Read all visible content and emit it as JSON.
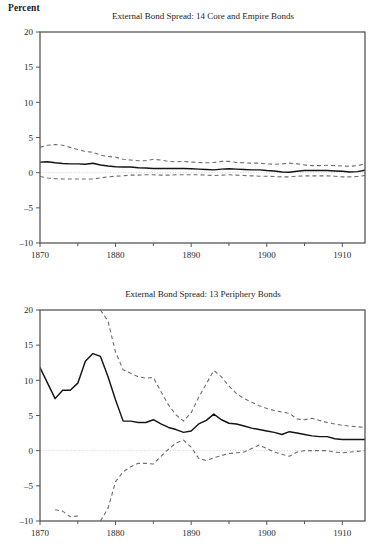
{
  "figure": {
    "axis_unit_label": "Percent",
    "background_color": "#ffffff",
    "mean_line_color": "#141414",
    "band_line_color": "#6d6d6d",
    "frame_color": "#575757",
    "zero_line_color": "#d2d2d2"
  },
  "chart_data": [
    {
      "type": "line",
      "panel_id": "top",
      "title": "External Bond Spread: 14 Core and Empire Bonds",
      "xlabel": "",
      "ylabel": "Percent",
      "xlim": [
        1870,
        1913
      ],
      "ylim": [
        -10,
        20
      ],
      "ytick_labels": [
        "20",
        "15",
        "10",
        "5",
        "0",
        "-5",
        "-10"
      ],
      "ytick_values": [
        20,
        15,
        10,
        5,
        0,
        -5,
        -10
      ],
      "xtick_labels": [
        "1870",
        "1880",
        "1890",
        "1900",
        "1910"
      ],
      "xtick_values": [
        1870,
        1880,
        1890,
        1900,
        1910
      ],
      "xtick_minor_values": [
        1875,
        1885,
        1895,
        1905
      ],
      "grid": false,
      "legend": "none",
      "zero_reference_line": 0,
      "x": [
        1870,
        1871,
        1872,
        1873,
        1874,
        1875,
        1876,
        1877,
        1878,
        1879,
        1880,
        1881,
        1882,
        1883,
        1884,
        1885,
        1886,
        1887,
        1888,
        1889,
        1890,
        1891,
        1892,
        1893,
        1894,
        1895,
        1896,
        1897,
        1898,
        1899,
        1900,
        1901,
        1902,
        1903,
        1904,
        1905,
        1906,
        1907,
        1908,
        1909,
        1910,
        1911,
        1912,
        1913
      ],
      "series": [
        {
          "name": "mean",
          "style": "solid",
          "values": [
            1.5,
            1.55,
            1.4,
            1.3,
            1.25,
            1.25,
            1.2,
            1.35,
            1.1,
            0.95,
            0.85,
            0.8,
            0.8,
            0.7,
            0.65,
            0.6,
            0.6,
            0.6,
            0.6,
            0.6,
            0.55,
            0.5,
            0.45,
            0.4,
            0.5,
            0.55,
            0.5,
            0.45,
            0.4,
            0.4,
            0.3,
            0.25,
            0.1,
            0.05,
            0.2,
            0.3,
            0.3,
            0.3,
            0.3,
            0.25,
            0.2,
            0.1,
            0.15,
            0.35
          ]
        },
        {
          "name": "upper_band",
          "style": "dashed",
          "values": [
            3.6,
            3.9,
            4.0,
            3.9,
            3.6,
            3.3,
            3.0,
            2.9,
            2.5,
            2.3,
            2.2,
            1.9,
            1.8,
            1.7,
            1.7,
            1.9,
            1.8,
            1.6,
            1.55,
            1.6,
            1.5,
            1.45,
            1.4,
            1.45,
            1.6,
            1.6,
            1.45,
            1.4,
            1.35,
            1.35,
            1.25,
            1.2,
            1.25,
            1.35,
            1.25,
            1.1,
            1.0,
            1.0,
            1.05,
            1.0,
            0.95,
            0.9,
            1.0,
            1.25
          ]
        },
        {
          "name": "lower_band",
          "style": "dashed",
          "values": [
            -0.55,
            -0.75,
            -0.85,
            -0.9,
            -0.9,
            -0.9,
            -0.9,
            -0.9,
            -0.75,
            -0.6,
            -0.5,
            -0.45,
            -0.35,
            -0.35,
            -0.3,
            -0.3,
            -0.35,
            -0.35,
            -0.3,
            -0.3,
            -0.3,
            -0.3,
            -0.35,
            -0.4,
            -0.35,
            -0.3,
            -0.35,
            -0.4,
            -0.45,
            -0.5,
            -0.5,
            -0.55,
            -0.6,
            -0.6,
            -0.5,
            -0.45,
            -0.45,
            -0.45,
            -0.45,
            -0.5,
            -0.6,
            -0.6,
            -0.55,
            -0.4
          ]
        }
      ]
    },
    {
      "type": "line",
      "panel_id": "bottom",
      "title": "External Bond Spread: 13 Periphery Bonds",
      "xlabel": "",
      "ylabel": "Percent",
      "xlim": [
        1870,
        1913
      ],
      "ylim": [
        -10,
        20
      ],
      "ytick_labels": [
        "20",
        "15",
        "10",
        "5",
        "0",
        "-5",
        "-10"
      ],
      "ytick_values": [
        20,
        15,
        10,
        5,
        0,
        -5,
        -10
      ],
      "xtick_labels": [
        "1870",
        "1880",
        "1890",
        "1900",
        "1910"
      ],
      "xtick_values": [
        1870,
        1880,
        1890,
        1900,
        1910
      ],
      "xtick_minor_values": [
        1875,
        1885,
        1895,
        1905
      ],
      "grid": false,
      "legend": "none",
      "zero_reference_line": 0,
      "x": [
        1870,
        1871,
        1872,
        1873,
        1874,
        1875,
        1876,
        1877,
        1878,
        1879,
        1880,
        1881,
        1882,
        1883,
        1884,
        1885,
        1886,
        1887,
        1888,
        1889,
        1890,
        1891,
        1892,
        1893,
        1894,
        1895,
        1896,
        1897,
        1898,
        1899,
        1900,
        1901,
        1902,
        1903,
        1904,
        1905,
        1906,
        1907,
        1908,
        1909,
        1910,
        1911,
        1912,
        1913
      ],
      "series": [
        {
          "name": "mean",
          "style": "solid",
          "values": [
            11.8,
            9.6,
            7.4,
            8.6,
            8.6,
            9.6,
            12.7,
            13.8,
            13.4,
            10.5,
            7.2,
            4.2,
            4.2,
            4.0,
            4.0,
            4.4,
            3.8,
            3.3,
            3.0,
            2.6,
            2.8,
            3.8,
            4.3,
            5.2,
            4.4,
            3.9,
            3.8,
            3.5,
            3.2,
            3.0,
            2.8,
            2.6,
            2.3,
            2.7,
            2.5,
            2.3,
            2.1,
            2.0,
            2.0,
            1.7,
            1.6,
            1.6,
            1.6,
            1.6
          ]
        },
        {
          "name": "upper_band",
          "style": "dashed",
          "values": [
            null,
            null,
            null,
            null,
            null,
            null,
            null,
            null,
            20.0,
            18.4,
            14.0,
            11.5,
            11.0,
            10.5,
            10.3,
            10.4,
            8.4,
            6.5,
            5.1,
            4.2,
            5.4,
            7.6,
            9.5,
            11.4,
            10.5,
            9.2,
            8.1,
            7.4,
            6.9,
            6.4,
            6.0,
            5.7,
            5.5,
            5.3,
            4.5,
            4.4,
            4.6,
            4.3,
            4.0,
            3.8,
            3.6,
            3.5,
            3.4,
            3.3
          ]
        },
        {
          "name": "lower_band",
          "style": "dashed",
          "values": [
            null,
            null,
            -8.4,
            -8.6,
            -9.4,
            -9.3,
            null,
            null,
            -10.0,
            -8.2,
            -4.4,
            -3.0,
            -2.3,
            -1.8,
            -1.8,
            -1.9,
            -0.8,
            0.2,
            1.1,
            1.5,
            0.5,
            -1.1,
            -1.4,
            -1.0,
            -0.7,
            -0.4,
            -0.3,
            -0.2,
            0.3,
            0.8,
            0.3,
            -0.2,
            -0.5,
            -0.8,
            -0.2,
            0.0,
            0.0,
            0.0,
            0.0,
            -0.2,
            -0.3,
            -0.2,
            -0.1,
            0.0
          ]
        }
      ]
    }
  ]
}
